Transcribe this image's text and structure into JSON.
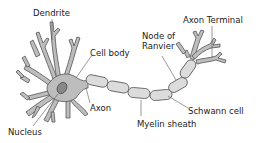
{
  "diagram": {
    "labels": {
      "dendrite": "Dendrite",
      "cell_body": "Cell body",
      "axon": "Axon",
      "nucleus": "Nucleus",
      "node_of_ranvier_line1": "Node of",
      "node_of_ranvier_line2": "Ranvier",
      "axon_terminal": "Axon Terminal",
      "schwann_cell": "Schwann cell",
      "myelin_sheath": "Myelin sheath"
    },
    "colors": {
      "cell_fill": "#bdbdbd",
      "outline": "#555555",
      "myelin_fill": "#dcdcdc",
      "nucleus_fill": "#888888",
      "text": "#222222",
      "background": "#ffffff"
    }
  }
}
